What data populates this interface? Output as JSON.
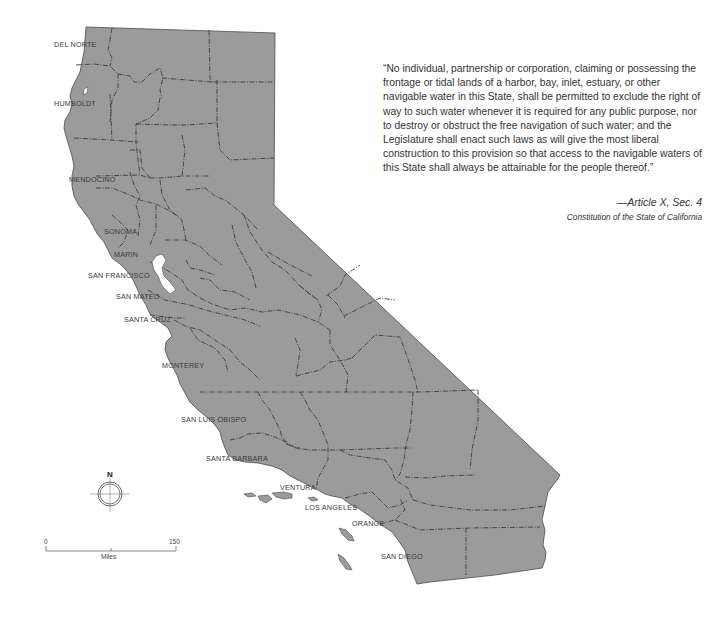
{
  "quote": {
    "text": "“No individual, partnership or corporation, claiming or possessing the frontage or tidal lands of a harbor, bay, inlet, estuary, or other navigable water in this State, shall be permitted to exclude the right of way to such water whenever it is required for any public purpose, nor to destroy or obstruct the free navigation of such water; and the Legislature shall enact such laws as will give the most liberal construction to this provision so that access to the navigable waters of this State shall always be attainable for the people thereof.”",
    "citation": "—Article X, Sec. 4",
    "source": "Constitution of the State of California"
  },
  "map": {
    "title": "California coastal counties",
    "fill_color": "#9b9b9b",
    "county_labels": [
      {
        "name": "DEL NORTE",
        "x": 54,
        "y": 40
      },
      {
        "name": "HUMBOLDT",
        "x": 54,
        "y": 99
      },
      {
        "name": "MENDOCINO",
        "x": 69,
        "y": 175
      },
      {
        "name": "SONOMA",
        "x": 104,
        "y": 227
      },
      {
        "name": "MARIN",
        "x": 114,
        "y": 250
      },
      {
        "name": "SAN FRANCISCO",
        "x": 88,
        "y": 271
      },
      {
        "name": "SAN MATEO",
        "x": 116,
        "y": 292
      },
      {
        "name": "SANTA CRUZ",
        "x": 124,
        "y": 315
      },
      {
        "name": "MONTEREY",
        "x": 162,
        "y": 361
      },
      {
        "name": "SAN LUIS OBISPO",
        "x": 181,
        "y": 415
      },
      {
        "name": "SANTA BARBARA",
        "x": 206,
        "y": 454
      },
      {
        "name": "VENTURA",
        "x": 280,
        "y": 483
      },
      {
        "name": "LOS ANGELES",
        "x": 305,
        "y": 503
      },
      {
        "name": "ORANGE",
        "x": 352,
        "y": 519
      },
      {
        "name": "SAN DIEGO",
        "x": 381,
        "y": 552
      }
    ],
    "compass": {
      "label": "N"
    },
    "scale": {
      "min": "0",
      "max": "150",
      "unit": "Miles"
    }
  }
}
